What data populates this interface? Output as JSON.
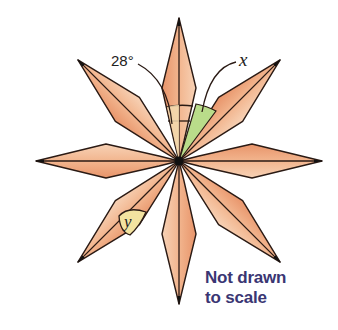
{
  "figure": {
    "center": [
      179,
      161
    ],
    "petal_count": 8,
    "petal_length": 143,
    "petal_side_distance": 73,
    "petal_half_width": 17,
    "colors": {
      "petal_fill": "#ec9f73",
      "petal_fill_light": "#f5c9a8",
      "outline": "#2a1a14",
      "angle_x_fill": "#b9dc8a",
      "angle_y_fill": "#f3e3a0",
      "angle_28_fill": "#f3dcb0",
      "note_color": "#3a3673"
    },
    "labels": {
      "angle_given": "28°",
      "angle_x": "x",
      "angle_y": "y"
    }
  },
  "note": {
    "line1": "Not drawn",
    "line2": "to scale"
  }
}
